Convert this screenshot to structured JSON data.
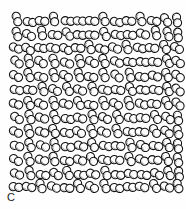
{
  "figure": {
    "panel_label": "C",
    "caption_text": "",
    "background_color": "#fefefe",
    "outline_color": "#111111",
    "fill_color": "#ffffff",
    "shading_color": "#9a9a9a"
  },
  "chart_data": {
    "type": "scatter",
    "title": "",
    "subtitle": "",
    "xlabel": "",
    "ylabel": "",
    "annotations": [
      "C"
    ],
    "legend": [],
    "grid": false,
    "xlim": [
      0,
      186
    ],
    "ylim": [
      0,
      209
    ],
    "marker": {
      "shape": "dimer-dumbbell",
      "description": "two overlapping circles forming a rigid dimer particle",
      "lobe_radius": 4.1,
      "lobe_separation": 5.6,
      "outline_width": 1.05
    },
    "field_bounds": {
      "x0": 11,
      "y0": 11,
      "x1": 181,
      "y1": 192
    },
    "row_count": 13,
    "particle_count": 168,
    "particles": [
      {
        "x": 17,
        "y": 19,
        "angle": 74
      },
      {
        "x": 30,
        "y": 22,
        "angle": 10
      },
      {
        "x": 42,
        "y": 21,
        "angle": 8
      },
      {
        "x": 54,
        "y": 19,
        "angle": 78
      },
      {
        "x": 68,
        "y": 21,
        "angle": 6
      },
      {
        "x": 80,
        "y": 21,
        "angle": 4
      },
      {
        "x": 92,
        "y": 21,
        "angle": 8
      },
      {
        "x": 104,
        "y": 19,
        "angle": 66
      },
      {
        "x": 117,
        "y": 22,
        "angle": 12
      },
      {
        "x": 129,
        "y": 21,
        "angle": 6
      },
      {
        "x": 141,
        "y": 19,
        "angle": 70
      },
      {
        "x": 154,
        "y": 21,
        "angle": 10
      },
      {
        "x": 166,
        "y": 20,
        "angle": 55
      },
      {
        "x": 177,
        "y": 20,
        "angle": 80
      },
      {
        "x": 17,
        "y": 34,
        "angle": 72
      },
      {
        "x": 29,
        "y": 35,
        "angle": 30
      },
      {
        "x": 42,
        "y": 33,
        "angle": 80
      },
      {
        "x": 55,
        "y": 35,
        "angle": 8
      },
      {
        "x": 68,
        "y": 34,
        "angle": 48
      },
      {
        "x": 80,
        "y": 35,
        "angle": 6
      },
      {
        "x": 92,
        "y": 35,
        "angle": 5
      },
      {
        "x": 105,
        "y": 34,
        "angle": 62
      },
      {
        "x": 118,
        "y": 35,
        "angle": 12
      },
      {
        "x": 130,
        "y": 35,
        "angle": 8
      },
      {
        "x": 143,
        "y": 34,
        "angle": 20
      },
      {
        "x": 156,
        "y": 33,
        "angle": 76
      },
      {
        "x": 168,
        "y": 34,
        "angle": 70
      },
      {
        "x": 178,
        "y": 35,
        "angle": 84
      },
      {
        "x": 16,
        "y": 48,
        "angle": 22
      },
      {
        "x": 28,
        "y": 49,
        "angle": 35
      },
      {
        "x": 41,
        "y": 48,
        "angle": 10
      },
      {
        "x": 53,
        "y": 48,
        "angle": 14
      },
      {
        "x": 66,
        "y": 49,
        "angle": 28
      },
      {
        "x": 78,
        "y": 48,
        "angle": 6
      },
      {
        "x": 90,
        "y": 47,
        "angle": 66
      },
      {
        "x": 102,
        "y": 49,
        "angle": 18
      },
      {
        "x": 115,
        "y": 48,
        "angle": 24
      },
      {
        "x": 127,
        "y": 47,
        "angle": 70
      },
      {
        "x": 140,
        "y": 48,
        "angle": 15
      },
      {
        "x": 152,
        "y": 48,
        "angle": 8
      },
      {
        "x": 165,
        "y": 47,
        "angle": 60
      },
      {
        "x": 177,
        "y": 48,
        "angle": 30
      },
      {
        "x": 17,
        "y": 62,
        "angle": 40
      },
      {
        "x": 29,
        "y": 61,
        "angle": 75
      },
      {
        "x": 41,
        "y": 62,
        "angle": 35
      },
      {
        "x": 54,
        "y": 61,
        "angle": 68
      },
      {
        "x": 67,
        "y": 63,
        "angle": 20
      },
      {
        "x": 80,
        "y": 61,
        "angle": 72
      },
      {
        "x": 92,
        "y": 62,
        "angle": 30
      },
      {
        "x": 104,
        "y": 61,
        "angle": 64
      },
      {
        "x": 117,
        "y": 62,
        "angle": 25
      },
      {
        "x": 130,
        "y": 62,
        "angle": 10
      },
      {
        "x": 143,
        "y": 62,
        "angle": 6
      },
      {
        "x": 155,
        "y": 62,
        "angle": 8
      },
      {
        "x": 168,
        "y": 61,
        "angle": 58
      },
      {
        "x": 178,
        "y": 62,
        "angle": 34
      },
      {
        "x": 16,
        "y": 76,
        "angle": 28
      },
      {
        "x": 29,
        "y": 75,
        "angle": 65
      },
      {
        "x": 41,
        "y": 77,
        "angle": 14
      },
      {
        "x": 54,
        "y": 75,
        "angle": 70
      },
      {
        "x": 66,
        "y": 76,
        "angle": 32
      },
      {
        "x": 79,
        "y": 75,
        "angle": 72
      },
      {
        "x": 91,
        "y": 77,
        "angle": 10
      },
      {
        "x": 104,
        "y": 75,
        "angle": 66
      },
      {
        "x": 117,
        "y": 76,
        "angle": 40
      },
      {
        "x": 130,
        "y": 75,
        "angle": 74
      },
      {
        "x": 142,
        "y": 77,
        "angle": 8
      },
      {
        "x": 155,
        "y": 76,
        "angle": 18
      },
      {
        "x": 167,
        "y": 75,
        "angle": 62
      },
      {
        "x": 178,
        "y": 76,
        "angle": 36
      },
      {
        "x": 17,
        "y": 90,
        "angle": 12
      },
      {
        "x": 30,
        "y": 90,
        "angle": 8
      },
      {
        "x": 43,
        "y": 89,
        "angle": 70
      },
      {
        "x": 55,
        "y": 90,
        "angle": 30
      },
      {
        "x": 68,
        "y": 89,
        "angle": 60
      },
      {
        "x": 80,
        "y": 90,
        "angle": 22
      },
      {
        "x": 93,
        "y": 89,
        "angle": 68
      },
      {
        "x": 105,
        "y": 90,
        "angle": 14
      },
      {
        "x": 118,
        "y": 90,
        "angle": 10
      },
      {
        "x": 131,
        "y": 89,
        "angle": 56
      },
      {
        "x": 143,
        "y": 90,
        "angle": 6
      },
      {
        "x": 156,
        "y": 90,
        "angle": 12
      },
      {
        "x": 168,
        "y": 89,
        "angle": 64
      },
      {
        "x": 178,
        "y": 90,
        "angle": 40
      },
      {
        "x": 16,
        "y": 104,
        "angle": 18
      },
      {
        "x": 29,
        "y": 103,
        "angle": 62
      },
      {
        "x": 41,
        "y": 104,
        "angle": 26
      },
      {
        "x": 54,
        "y": 103,
        "angle": 70
      },
      {
        "x": 66,
        "y": 104,
        "angle": 16
      },
      {
        "x": 79,
        "y": 103,
        "angle": 58
      },
      {
        "x": 91,
        "y": 105,
        "angle": 10
      },
      {
        "x": 104,
        "y": 103,
        "angle": 66
      },
      {
        "x": 116,
        "y": 104,
        "angle": 30
      },
      {
        "x": 129,
        "y": 103,
        "angle": 72
      },
      {
        "x": 142,
        "y": 104,
        "angle": 20
      },
      {
        "x": 154,
        "y": 104,
        "angle": 8
      },
      {
        "x": 167,
        "y": 103,
        "angle": 60
      },
      {
        "x": 178,
        "y": 104,
        "angle": 44
      },
      {
        "x": 17,
        "y": 118,
        "angle": 34
      },
      {
        "x": 30,
        "y": 117,
        "angle": 68
      },
      {
        "x": 42,
        "y": 118,
        "angle": 20
      },
      {
        "x": 55,
        "y": 117,
        "angle": 64
      },
      {
        "x": 68,
        "y": 119,
        "angle": 10
      },
      {
        "x": 80,
        "y": 118,
        "angle": 16
      },
      {
        "x": 93,
        "y": 117,
        "angle": 70
      },
      {
        "x": 105,
        "y": 118,
        "angle": 28
      },
      {
        "x": 118,
        "y": 117,
        "angle": 62
      },
      {
        "x": 131,
        "y": 118,
        "angle": 14
      },
      {
        "x": 143,
        "y": 118,
        "angle": 8
      },
      {
        "x": 156,
        "y": 117,
        "angle": 58
      },
      {
        "x": 168,
        "y": 118,
        "angle": 36
      },
      {
        "x": 178,
        "y": 118,
        "angle": 78
      },
      {
        "x": 16,
        "y": 132,
        "angle": 26
      },
      {
        "x": 29,
        "y": 131,
        "angle": 72
      },
      {
        "x": 42,
        "y": 132,
        "angle": 18
      },
      {
        "x": 54,
        "y": 131,
        "angle": 60
      },
      {
        "x": 67,
        "y": 133,
        "angle": 12
      },
      {
        "x": 79,
        "y": 132,
        "angle": 30
      },
      {
        "x": 92,
        "y": 131,
        "angle": 66
      },
      {
        "x": 104,
        "y": 132,
        "angle": 22
      },
      {
        "x": 117,
        "y": 131,
        "angle": 70
      },
      {
        "x": 130,
        "y": 132,
        "angle": 10
      },
      {
        "x": 142,
        "y": 132,
        "angle": 6
      },
      {
        "x": 155,
        "y": 131,
        "angle": 56
      },
      {
        "x": 167,
        "y": 132,
        "angle": 38
      },
      {
        "x": 178,
        "y": 132,
        "angle": 74
      },
      {
        "x": 17,
        "y": 146,
        "angle": 14
      },
      {
        "x": 30,
        "y": 145,
        "angle": 64
      },
      {
        "x": 43,
        "y": 146,
        "angle": 24
      },
      {
        "x": 55,
        "y": 145,
        "angle": 70
      },
      {
        "x": 68,
        "y": 147,
        "angle": 8
      },
      {
        "x": 81,
        "y": 146,
        "angle": 18
      },
      {
        "x": 93,
        "y": 145,
        "angle": 60
      },
      {
        "x": 106,
        "y": 146,
        "angle": 12
      },
      {
        "x": 118,
        "y": 146,
        "angle": 6
      },
      {
        "x": 131,
        "y": 145,
        "angle": 68
      },
      {
        "x": 143,
        "y": 146,
        "angle": 32
      },
      {
        "x": 156,
        "y": 146,
        "angle": 10
      },
      {
        "x": 168,
        "y": 145,
        "angle": 62
      },
      {
        "x": 178,
        "y": 146,
        "angle": 80
      },
      {
        "x": 16,
        "y": 160,
        "angle": 30
      },
      {
        "x": 29,
        "y": 159,
        "angle": 66
      },
      {
        "x": 42,
        "y": 160,
        "angle": 16
      },
      {
        "x": 54,
        "y": 159,
        "angle": 72
      },
      {
        "x": 67,
        "y": 161,
        "angle": 10
      },
      {
        "x": 80,
        "y": 160,
        "angle": 20
      },
      {
        "x": 92,
        "y": 159,
        "angle": 58
      },
      {
        "x": 105,
        "y": 160,
        "angle": 14
      },
      {
        "x": 117,
        "y": 160,
        "angle": 8
      },
      {
        "x": 130,
        "y": 159,
        "angle": 64
      },
      {
        "x": 142,
        "y": 160,
        "angle": 26
      },
      {
        "x": 155,
        "y": 160,
        "angle": 6
      },
      {
        "x": 167,
        "y": 159,
        "angle": 60
      },
      {
        "x": 178,
        "y": 160,
        "angle": 76
      },
      {
        "x": 17,
        "y": 174,
        "angle": 22
      },
      {
        "x": 30,
        "y": 173,
        "angle": 70
      },
      {
        "x": 43,
        "y": 175,
        "angle": 10
      },
      {
        "x": 56,
        "y": 174,
        "angle": 34
      },
      {
        "x": 68,
        "y": 173,
        "angle": 62
      },
      {
        "x": 81,
        "y": 175,
        "angle": 8
      },
      {
        "x": 93,
        "y": 174,
        "angle": 16
      },
      {
        "x": 106,
        "y": 173,
        "angle": 66
      },
      {
        "x": 118,
        "y": 175,
        "angle": 6
      },
      {
        "x": 131,
        "y": 174,
        "angle": 12
      },
      {
        "x": 144,
        "y": 175,
        "angle": 9
      },
      {
        "x": 157,
        "y": 174,
        "angle": 28
      },
      {
        "x": 169,
        "y": 173,
        "angle": 64
      },
      {
        "x": 179,
        "y": 174,
        "angle": 82
      },
      {
        "x": 16,
        "y": 187,
        "angle": 8
      },
      {
        "x": 29,
        "y": 187,
        "angle": 12
      },
      {
        "x": 41,
        "y": 186,
        "angle": 68
      },
      {
        "x": 54,
        "y": 187,
        "angle": 24
      },
      {
        "x": 67,
        "y": 188,
        "angle": 6
      },
      {
        "x": 79,
        "y": 186,
        "angle": 60
      },
      {
        "x": 92,
        "y": 187,
        "angle": 30
      },
      {
        "x": 105,
        "y": 186,
        "angle": 66
      },
      {
        "x": 117,
        "y": 188,
        "angle": 10
      },
      {
        "x": 130,
        "y": 187,
        "angle": 7
      },
      {
        "x": 142,
        "y": 187,
        "angle": 14
      },
      {
        "x": 155,
        "y": 186,
        "angle": 58
      },
      {
        "x": 167,
        "y": 187,
        "angle": 20
      },
      {
        "x": 178,
        "y": 186,
        "angle": 72
      }
    ]
  }
}
